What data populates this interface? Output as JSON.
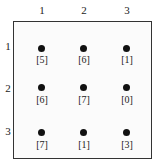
{
  "columns": [
    "1",
    "2",
    "3"
  ],
  "rows": [
    "1",
    "2",
    "3"
  ],
  "cells": [
    [
      "[5]",
      "[6]",
      "[1]"
    ],
    [
      "[6]",
      "[7]",
      "[0]"
    ],
    [
      "[7]",
      "[1]",
      "[3]"
    ]
  ]
}
